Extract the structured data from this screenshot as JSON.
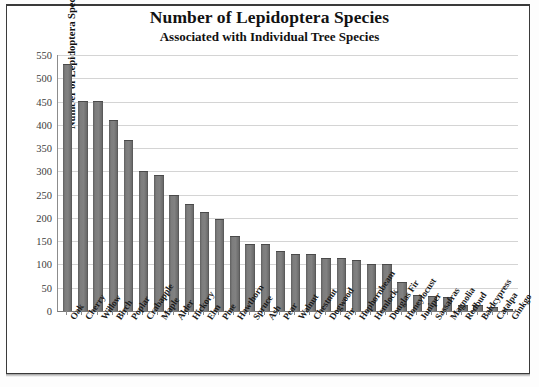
{
  "document": {
    "title_line1": "Number of Lepidoptera Species",
    "title_line2": "Associated with Individual Tree Species"
  },
  "colors": {
    "bar_fill": "#7d7d7d",
    "bar_edge": "#4a4a4a",
    "gridline": "#d4d4d4",
    "axis": "#7a7a7a",
    "text": "#111111",
    "page_border": "#3a3a3a"
  },
  "chart_data": {
    "type": "bar",
    "title": "Number of Lepidoptera Species",
    "subtitle": "Associated with Individual Tree Species",
    "xlabel": "",
    "ylabel": "Number of Lepidoptera Species",
    "ylim": [
      0,
      550
    ],
    "ytick_step": 50,
    "yticks": [
      550,
      500,
      450,
      400,
      350,
      300,
      250,
      200,
      150,
      100,
      50,
      0
    ],
    "grid": true,
    "legend": false,
    "categories": [
      "Oak",
      "Cherry",
      "Willow",
      "Birch",
      "Poplar",
      "Crabapple",
      "Maple",
      "Alder",
      "Hickory",
      "Elm",
      "Pine",
      "Hawthorn",
      "Spruce",
      "Ash",
      "Pear",
      "Walnut",
      "Chestnut",
      "Dogwood",
      "Fir",
      "Hophornbeam",
      "Hemlock",
      "Douglas Fir",
      "Honeylocust",
      "Juniper",
      "Sassafras",
      "Magnolia",
      "Redbud",
      "Baldcypress",
      "Catalpa",
      "Ginkgo"
    ],
    "values": [
      530,
      452,
      452,
      410,
      368,
      300,
      293,
      250,
      230,
      212,
      197,
      162,
      145,
      143,
      130,
      123,
      122,
      113,
      113,
      110,
      100,
      100,
      62,
      35,
      33,
      30,
      13,
      12,
      8,
      4
    ]
  }
}
